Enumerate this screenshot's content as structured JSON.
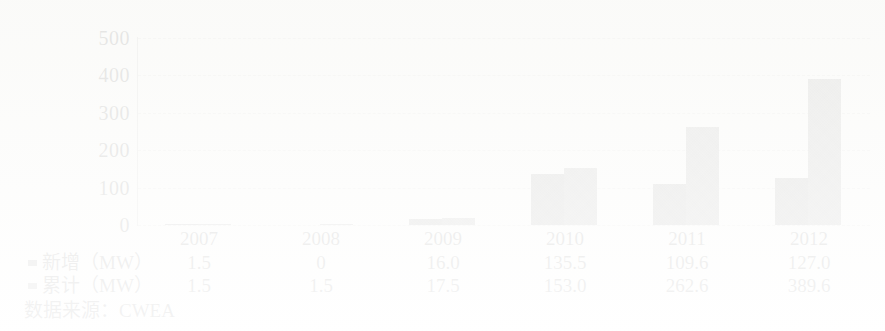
{
  "chart_data": {
    "type": "bar",
    "title": "",
    "subtitle": "",
    "xlabel": "",
    "ylabel": "",
    "ylim": [
      0,
      500
    ],
    "yticks": [
      0,
      100,
      200,
      300,
      400,
      500
    ],
    "ytick_labels": [
      "0",
      "100",
      "200",
      "300",
      "400",
      "500"
    ],
    "grid": true,
    "grid_style": "dashed-horizontal",
    "legend_position": "below-table",
    "categories": [
      "2007",
      "2008",
      "2009",
      "2010",
      "2011",
      "2012"
    ],
    "series": [
      {
        "name": "新增（MW）",
        "color": "#575757",
        "values": [
          1.5,
          0,
          16.0,
          135.5,
          109.6,
          127.0
        ],
        "value_labels": [
          "1.5",
          "0",
          "16.0",
          "135.5",
          "109.6",
          "127.0"
        ]
      },
      {
        "name": "累计（MW）",
        "color": "#6d6d6d",
        "values": [
          1.5,
          1.5,
          17.5,
          153.0,
          262.6,
          389.6
        ],
        "value_labels": [
          "1.5",
          "1.5",
          "17.5",
          "153.0",
          "262.6",
          "389.6"
        ]
      }
    ],
    "source_note": "数据来源：CWEA"
  },
  "axis": {
    "y_tick_labels": [
      "500",
      "400",
      "300",
      "200",
      "100",
      "0"
    ]
  },
  "legend": {
    "marker_icon": "legend-square-icon"
  }
}
